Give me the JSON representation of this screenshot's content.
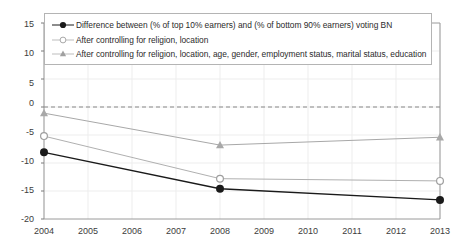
{
  "chart_data": {
    "type": "line",
    "title": "",
    "xlabel": "",
    "ylabel": "",
    "x": [
      2004,
      2008,
      2013
    ],
    "xticklabels": [
      "2004",
      "2005",
      "2006",
      "2007",
      "2008",
      "2009",
      "2010",
      "2011",
      "2012",
      "2013"
    ],
    "yticklabels": [
      "15",
      "10",
      "5",
      "0",
      "-5",
      "-10",
      "-15",
      "-20"
    ],
    "yticks": [
      15,
      10,
      5,
      0,
      -5,
      -10,
      -15,
      -20
    ],
    "xlim": [
      2004,
      2013
    ],
    "ylim": [
      -20,
      15
    ],
    "grid": true,
    "legend_position": "upper left",
    "reference_line": {
      "value": 0,
      "style": "dashed",
      "color": "#888888"
    },
    "series": [
      {
        "name": "Difference between (% of top 10% earners) and (% of bottom 90% earners) voting BN",
        "marker": "filled-circle",
        "color": "#1a1a1a",
        "values": [
          -8.1,
          -14.6,
          -16.6
        ]
      },
      {
        "name": "After controlling for religion, location",
        "marker": "open-circle",
        "color": "#b0b0b0",
        "values": [
          -5.2,
          -12.8,
          -13.2
        ]
      },
      {
        "name": "After controlling for religion, location, age, gender, employment status, marital status, education",
        "marker": "filled-triangle",
        "color": "#a8a8a8",
        "values": [
          -1.1,
          -6.8,
          -5.4
        ]
      }
    ]
  },
  "legend": {
    "items": [
      {
        "label": "Difference between (% of top 10% earners) and (% of bottom 90% earners) voting BN"
      },
      {
        "label": "After controlling for religion, location"
      },
      {
        "label": "After controlling for religion, location, age, gender, employment status, marital status, education"
      }
    ]
  },
  "axes": {
    "y_labels": [
      "15",
      "10",
      "5",
      "0",
      "-5",
      "-10",
      "-15",
      "-20"
    ],
    "x_labels": [
      "2004",
      "2005",
      "2006",
      "2007",
      "2008",
      "2009",
      "2010",
      "2011",
      "2012",
      "2013"
    ]
  }
}
